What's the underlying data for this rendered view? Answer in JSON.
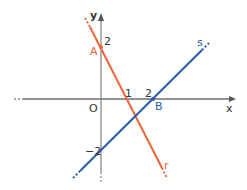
{
  "diagram": {
    "type": "coordinate-plane",
    "axes": {
      "x_label": "x",
      "y_label": "y",
      "origin_label": "O"
    },
    "ticks": {
      "x_1": "1",
      "x_2": "2",
      "y_2": "2",
      "y_neg2": "−2"
    },
    "points": {
      "A": {
        "label": "A",
        "coords": [
          0,
          2
        ]
      },
      "B": {
        "label": "B",
        "coords": [
          2,
          0
        ]
      }
    },
    "lines": {
      "r": {
        "label": "r",
        "color": "#f0643c",
        "through": [
          "A",
          "(1,0)"
        ]
      },
      "s": {
        "label": "s",
        "color": "#2a5ba8",
        "through": [
          "B",
          "(0,-2)"
        ]
      }
    },
    "colors": {
      "axis": "#8a8a8a",
      "text": "#333333",
      "r": "#f0643c",
      "s": "#2a5ba8"
    }
  }
}
